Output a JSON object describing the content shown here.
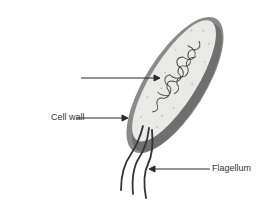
{
  "diagram": {
    "labels": {
      "dna": "Bacterial DNA",
      "cell_wall": "Cell wall",
      "flagellum": "Flagellum"
    },
    "colors": {
      "cell_wall": "#8a8a8a",
      "cell_wall_dark": "#6e6e6e",
      "cytoplasm": "#e9e9e6",
      "dna": "#444444",
      "arrow": "#2b2b2b",
      "flagella": "#333333"
    }
  }
}
